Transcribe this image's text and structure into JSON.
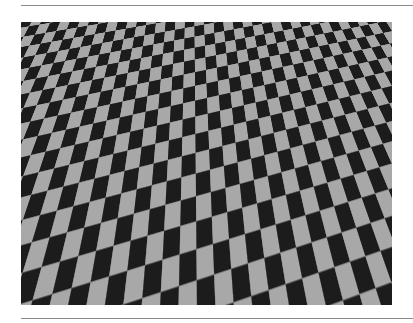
{
  "figure": {
    "subject": "perspective checkerboard floor",
    "colors": {
      "dark_tile": "#1c1c1c",
      "light_tile": "#a8a8a8",
      "grout": "#707070",
      "rule": "#8a8a8a",
      "background": "#ffffff"
    }
  }
}
